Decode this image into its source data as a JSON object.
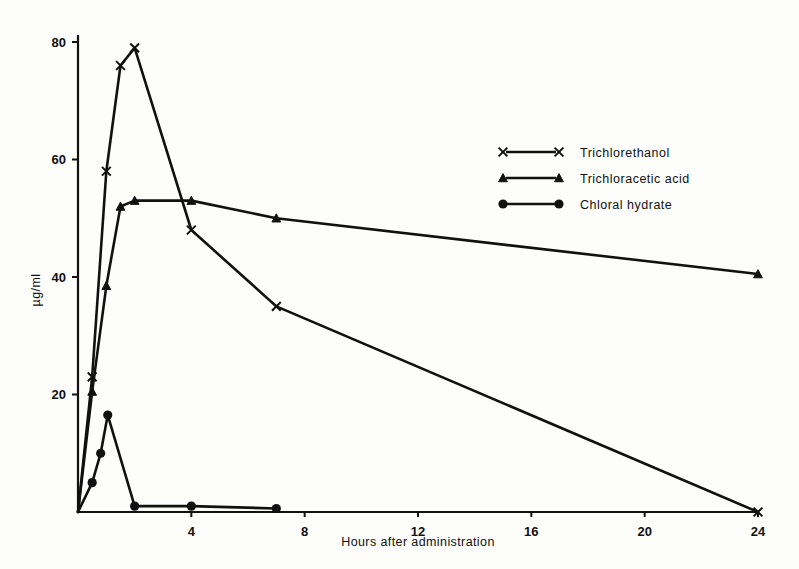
{
  "chart_data": {
    "type": "line",
    "title": "",
    "xlabel": "Hours after administration",
    "ylabel": "µg/ml",
    "xlim": [
      0,
      24
    ],
    "ylim": [
      0,
      80
    ],
    "xticks": [
      4,
      8,
      12,
      16,
      20,
      24
    ],
    "yticks": [
      20,
      40,
      60,
      80
    ],
    "grid": false,
    "legend_position": "upper right",
    "series": [
      {
        "name": "Trichlorethanol",
        "marker": "x",
        "x": [
          0,
          0.5,
          1,
          1.5,
          2,
          4,
          7,
          24
        ],
        "y": [
          0,
          23,
          58,
          76,
          79,
          48,
          35,
          0
        ]
      },
      {
        "name": "Trichloracetic acid",
        "marker": "triangle",
        "x": [
          0,
          0.5,
          1,
          1.5,
          2,
          4,
          7,
          24
        ],
        "y": [
          0,
          20.5,
          38.5,
          52,
          53,
          53,
          50,
          40.5
        ]
      },
      {
        "name": "Chloral hydrate",
        "marker": "circle",
        "x": [
          0,
          0.5,
          0.8,
          1.05,
          2,
          4,
          7
        ],
        "y": [
          0,
          5,
          10,
          16.5,
          1,
          1,
          0.6
        ]
      }
    ]
  },
  "legend": {
    "entries": [
      {
        "label": "Trichlorethanol",
        "marker": "x"
      },
      {
        "label": "Trichloracetic acid",
        "marker": "triangle"
      },
      {
        "label": "Chloral hydrate",
        "marker": "circle"
      }
    ]
  },
  "axes": {
    "x_tick_labels": [
      "4",
      "8",
      "12",
      "16",
      "20",
      "24"
    ],
    "y_tick_labels": [
      "20",
      "40",
      "60",
      "80"
    ],
    "x_axis_title": "Hours after administration",
    "y_axis_title": "µg/ml"
  }
}
